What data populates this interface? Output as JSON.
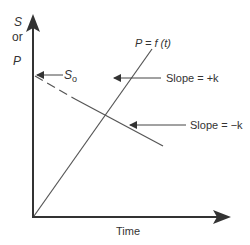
{
  "axes": {
    "y_label_top": "S",
    "y_label_mid": "or",
    "y_label_bottom": "P",
    "x_label": "Time"
  },
  "annotations": {
    "s0": "S",
    "s0_sub": "o",
    "p_func": "P = f (t)",
    "slope_pos": "Slope = +k",
    "slope_neg": "Slope = −k"
  },
  "colors": {
    "line": "#444444",
    "axis": "#333333"
  }
}
